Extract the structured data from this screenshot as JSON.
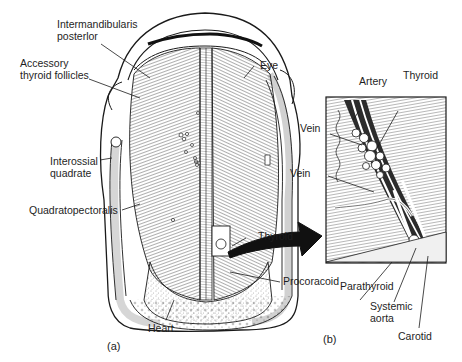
{
  "figure": {
    "panels": [
      {
        "id": "a",
        "label": "(a)"
      },
      {
        "id": "b",
        "label": "(b)"
      }
    ],
    "labels_a": {
      "intermandibularis": "Intermandibularis\nposterlor",
      "accessory": "Accessory\nthyroid follicles",
      "interossial": "Interossial\nquadrate",
      "quadratopectoralis": "Quadratopectoralis",
      "eye": "Eye",
      "thyroid": "Thyroid",
      "procoracoid": "Procoracoid",
      "heart": "Heart"
    },
    "labels_b": {
      "artery": "Artery",
      "thyroid": "Thyroid",
      "vein_upper": "Vein",
      "vein_lower": "Vein",
      "parathyroid": "Parathyroid",
      "systemic_aorta": "Systemic\naorta",
      "carotid": "Carotid"
    },
    "colors": {
      "ink": "#1a1a1a",
      "background": "#ffffff",
      "shade": "#d9d9d9"
    }
  }
}
